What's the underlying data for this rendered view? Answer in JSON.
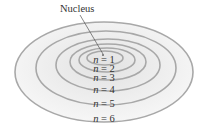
{
  "diagram": {
    "nucleus_label": "Nucleus",
    "colors": {
      "ring_stroke": "#a8a8a8",
      "fill_outer": "#f4f4f4",
      "fill_inner": "#e6e6e6",
      "text": "#333333",
      "pointer": "#555555"
    },
    "levels": [
      {
        "label": "n = 1",
        "var": "n",
        "value": "1"
      },
      {
        "label": "n = 2",
        "var": "n",
        "value": "2"
      },
      {
        "label": "n = 3",
        "var": "n",
        "value": "3"
      },
      {
        "label": "n = 4",
        "var": "n",
        "value": "4"
      },
      {
        "label": "n = 5",
        "var": "n",
        "value": "5"
      },
      {
        "label": "n = 6",
        "var": "n",
        "value": "6"
      }
    ]
  }
}
